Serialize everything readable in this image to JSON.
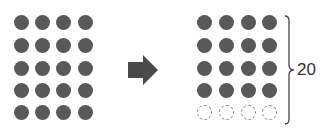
{
  "diagram": {
    "colors": {
      "filled_dot": "#595959",
      "empty_dot_border": "#8a8a8a",
      "arrow": "#4a4a4a",
      "text": "#333333"
    },
    "left_grid": {
      "columns": 4,
      "rows": 5,
      "cells": [
        [
          "filled",
          "filled",
          "filled",
          "filled"
        ],
        [
          "filled",
          "filled",
          "filled",
          "filled"
        ],
        [
          "filled",
          "filled",
          "filled",
          "filled"
        ],
        [
          "filled",
          "filled",
          "filled",
          "filled"
        ],
        [
          "filled",
          "filled",
          "filled",
          "filled"
        ]
      ]
    },
    "arrow": {
      "direction": "right",
      "icon": "right-arrow-icon"
    },
    "right_grid": {
      "columns": 4,
      "rows": 5,
      "cells": [
        [
          "filled",
          "filled",
          "filled",
          "filled"
        ],
        [
          "filled",
          "filled",
          "filled",
          "filled"
        ],
        [
          "filled",
          "filled",
          "filled",
          "filled"
        ],
        [
          "filled",
          "filled",
          "filled",
          "filled"
        ],
        [
          "empty",
          "empty",
          "empty",
          "empty"
        ]
      ]
    },
    "brace": {
      "side": "right",
      "label": "20"
    }
  }
}
